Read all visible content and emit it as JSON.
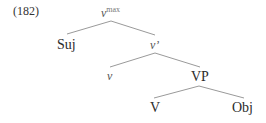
{
  "example": {
    "number": "(182)"
  },
  "tree": {
    "root": {
      "label": "v",
      "superscript": "max"
    },
    "nodes": {
      "subject": "Suj",
      "v_bar": "v’",
      "v_head": "v",
      "vp": "VP",
      "verb": "V",
      "object": "Obj"
    },
    "edges": [
      [
        "v^max",
        "Suj"
      ],
      [
        "v^max",
        "v'"
      ],
      [
        "v'",
        "v"
      ],
      [
        "v'",
        "VP"
      ],
      [
        "VP",
        "V"
      ],
      [
        "VP",
        "Obj"
      ]
    ]
  },
  "colors": {
    "text": "#2b2b2b",
    "italic": "#555555",
    "branch": "#9a9a9a"
  }
}
